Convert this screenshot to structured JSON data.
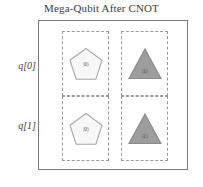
{
  "figure": {
    "title": "Mega-Qubit After CNOT",
    "frame": {
      "border_color": "#7c7c7c",
      "background": "#ffffff"
    },
    "cell_border_color": "#9a9a9a"
  },
  "rows": [
    {
      "id": "q0",
      "label": "q[0]"
    },
    {
      "id": "q1",
      "label": "q[1]"
    }
  ],
  "columns": [
    {
      "id": "col0",
      "state": "|0⟩"
    },
    {
      "id": "col1",
      "state": "|1⟩"
    }
  ],
  "shapes": [
    {
      "id": "q0-state0",
      "row": "q[0]",
      "column": "|0⟩",
      "glyph": "pentagon",
      "label": "|0⟩",
      "fill": "#f7f7f7",
      "stroke": "#a8a8a8"
    },
    {
      "id": "q0-state1",
      "row": "q[0]",
      "column": "|1⟩",
      "glyph": "triangle",
      "label": "|1⟩",
      "fill": "#9d9d9d",
      "stroke": "#8a8a8a"
    },
    {
      "id": "q1-state0",
      "row": "q[1]",
      "column": "|0⟩",
      "glyph": "pentagon",
      "label": "|0⟩",
      "fill": "#f7f7f7",
      "stroke": "#a8a8a8"
    },
    {
      "id": "q1-state1",
      "row": "q[1]",
      "column": "|1⟩",
      "glyph": "triangle",
      "label": "|1⟩",
      "fill": "#9d9d9d",
      "stroke": "#8a8a8a"
    }
  ]
}
